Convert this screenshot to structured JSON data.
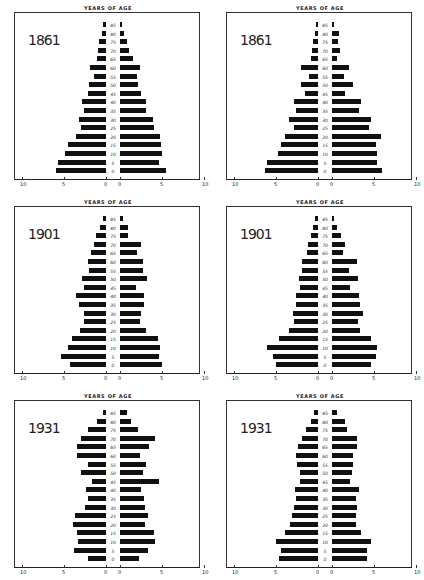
{
  "chart_data": [
    {
      "type": "bar",
      "title": "1861",
      "subtitle": "YEARS OF AGE",
      "orientation": "horizontal-pyramid",
      "categories": [
        "0",
        "5",
        "10",
        "15",
        "20",
        "25",
        "30",
        "35",
        "40",
        "45",
        "50",
        "55",
        "60",
        "65",
        "70",
        "75",
        "80",
        "85"
      ],
      "xlim": [
        0,
        10
      ],
      "xticks_left": [
        "10",
        "5",
        "0"
      ],
      "xticks_right": [
        "0",
        "5",
        "10"
      ],
      "series": [
        {
          "name": "left",
          "values": [
            6.0,
            5.7,
            4.9,
            4.5,
            3.6,
            3.0,
            3.2,
            2.6,
            2.9,
            2.1,
            2.0,
            1.4,
            1.9,
            1.1,
            1.0,
            0.8,
            0.5,
            0.3
          ]
        },
        {
          "name": "right",
          "values": [
            5.5,
            4.7,
            5.0,
            4.9,
            4.8,
            4.0,
            3.9,
            3.1,
            3.1,
            2.5,
            2.2,
            2.0,
            2.4,
            1.5,
            1.1,
            0.8,
            0.5,
            0.2
          ]
        }
      ]
    },
    {
      "type": "bar",
      "title": "1861",
      "subtitle": "YEARS OF AGE",
      "orientation": "horizontal-pyramid",
      "categories": [
        "0",
        "5",
        "10",
        "15",
        "20",
        "25",
        "30",
        "35",
        "40",
        "45",
        "50",
        "55",
        "60",
        "65",
        "70",
        "75",
        "80",
        "85"
      ],
      "xlim": [
        0,
        10
      ],
      "xticks_left": [
        "10",
        "5",
        "0"
      ],
      "xticks_right": [
        "0",
        "5",
        "10"
      ],
      "series": [
        {
          "name": "left",
          "values": [
            6.3,
            6.1,
            4.8,
            4.4,
            3.9,
            2.9,
            3.5,
            2.6,
            2.9,
            1.5,
            2.0,
            1.1,
            2.0,
            0.8,
            0.7,
            0.6,
            0.4,
            0.2
          ]
        },
        {
          "name": "right",
          "values": [
            6.0,
            5.3,
            5.3,
            5.2,
            5.8,
            4.4,
            4.6,
            3.2,
            3.4,
            1.6,
            2.5,
            1.4,
            2.0,
            0.6,
            1.0,
            0.7,
            0.8,
            0.2
          ]
        }
      ]
    },
    {
      "type": "bar",
      "title": "1901",
      "subtitle": "YEARS OF AGE",
      "orientation": "horizontal-pyramid",
      "categories": [
        "0",
        "5",
        "10",
        "15",
        "20",
        "25",
        "30",
        "35",
        "40",
        "45",
        "50",
        "55",
        "60",
        "65",
        "70",
        "75",
        "80",
        "85"
      ],
      "xlim": [
        0,
        10
      ],
      "xticks_left": [
        "10",
        "5",
        "0"
      ],
      "xticks_right": [
        "0",
        "5",
        "10"
      ],
      "series": [
        {
          "name": "left",
          "values": [
            4.3,
            5.3,
            4.5,
            4.0,
            3.1,
            2.6,
            2.6,
            3.2,
            3.6,
            2.6,
            2.8,
            2.0,
            2.2,
            1.8,
            1.4,
            1.2,
            0.7,
            0.3
          ]
        },
        {
          "name": "right",
          "values": [
            5.0,
            4.7,
            4.8,
            4.5,
            3.1,
            2.4,
            2.5,
            2.8,
            2.8,
            1.9,
            3.2,
            2.7,
            2.7,
            2.0,
            2.5,
            1.0,
            0.9,
            0.4
          ]
        }
      ]
    },
    {
      "type": "bar",
      "title": "1901",
      "subtitle": "YEARS OF AGE",
      "orientation": "horizontal-pyramid",
      "categories": [
        "0",
        "5",
        "10",
        "15",
        "20",
        "25",
        "30",
        "35",
        "40",
        "45",
        "50",
        "55",
        "60",
        "65",
        "70",
        "75",
        "80",
        "85"
      ],
      "xlim": [
        0,
        10
      ],
      "xticks_left": [
        "10",
        "5",
        "0"
      ],
      "xticks_right": [
        "0",
        "5",
        "10"
      ],
      "series": [
        {
          "name": "left",
          "values": [
            5.0,
            5.3,
            6.1,
            4.7,
            3.4,
            2.8,
            3.0,
            2.6,
            2.6,
            2.2,
            2.3,
            1.9,
            1.9,
            1.3,
            1.2,
            0.8,
            0.6,
            0.3
          ]
        },
        {
          "name": "right",
          "values": [
            4.7,
            5.2,
            5.4,
            4.7,
            3.3,
            3.1,
            3.7,
            3.3,
            3.2,
            2.2,
            3.1,
            2.0,
            3.0,
            1.3,
            1.5,
            1.1,
            0.6,
            0.2
          ]
        }
      ]
    },
    {
      "type": "bar",
      "title": "1931",
      "subtitle": "YEARS OF AGE",
      "orientation": "horizontal-pyramid",
      "categories": [
        "0",
        "5",
        "10",
        "15",
        "20",
        "25",
        "30",
        "35",
        "40",
        "45",
        "50",
        "55",
        "60",
        "65",
        "70",
        "75",
        "80",
        "85"
      ],
      "xlim": [
        0,
        10
      ],
      "xticks_left": [
        "10",
        "5",
        "0"
      ],
      "xticks_right": [
        "0",
        "5",
        "10"
      ],
      "series": [
        {
          "name": "left",
          "values": [
            2.2,
            3.8,
            3.3,
            3.4,
            3.9,
            3.7,
            2.5,
            2.2,
            2.4,
            1.7,
            3.0,
            2.1,
            3.5,
            3.4,
            3.0,
            2.1,
            1.1,
            0.3
          ]
        },
        {
          "name": "right",
          "values": [
            2.3,
            3.3,
            4.2,
            4.0,
            3.0,
            3.3,
            3.0,
            2.9,
            2.5,
            4.6,
            2.7,
            3.1,
            2.4,
            3.4,
            4.2,
            2.1,
            1.3,
            0.8
          ]
        }
      ]
    },
    {
      "type": "bar",
      "title": "1931",
      "subtitle": "YEARS OF AGE",
      "orientation": "horizontal-pyramid",
      "categories": [
        "0",
        "5",
        "10",
        "15",
        "20",
        "25",
        "30",
        "35",
        "40",
        "45",
        "50",
        "55",
        "60",
        "65",
        "70",
        "75",
        "80",
        "85"
      ],
      "xlim": [
        0,
        10
      ],
      "xticks_left": [
        "10",
        "5",
        "0"
      ],
      "xticks_right": [
        "0",
        "5",
        "10"
      ],
      "series": [
        {
          "name": "left",
          "values": [
            4.7,
            4.4,
            5.0,
            3.9,
            3.3,
            3.1,
            2.8,
            2.6,
            2.7,
            2.2,
            2.2,
            2.5,
            2.6,
            2.4,
            1.9,
            1.4,
            0.8,
            0.5
          ]
        },
        {
          "name": "right",
          "values": [
            4.2,
            4.2,
            4.6,
            3.4,
            2.8,
            2.9,
            3.0,
            2.9,
            3.2,
            2.2,
            2.4,
            2.5,
            2.5,
            3.0,
            3.0,
            1.8,
            1.6,
            0.6
          ]
        }
      ]
    }
  ],
  "panels": [
    {
      "year": "1861",
      "header": "YEARS OF AGE"
    },
    {
      "year": "1861",
      "header": "YEARS OF AGE"
    },
    {
      "year": "1901",
      "header": "YEARS OF AGE"
    },
    {
      "year": "1901",
      "header": "YEARS OF AGE"
    },
    {
      "year": "1931",
      "header": "YEARS OF AGE"
    },
    {
      "year": "1931",
      "header": "YEARS OF AGE"
    }
  ],
  "age_labels": [
    "0",
    "5",
    "10",
    "15",
    "20",
    "25",
    "30",
    "35",
    "40",
    "45",
    "50",
    "55",
    "60",
    "65",
    "70",
    "75",
    "80",
    "85"
  ],
  "axis_ticks": {
    "left": [
      "10",
      "5",
      "0"
    ],
    "right": [
      "0",
      "5",
      "10"
    ]
  }
}
